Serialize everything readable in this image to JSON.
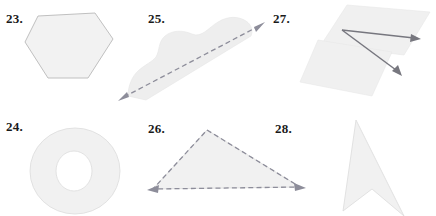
{
  "page": {
    "width": 436,
    "height": 216,
    "background_color": "#ffffff"
  },
  "style_colors": {
    "shape_fill": "#f2f2f2",
    "shape_outline": "#b9b9b9",
    "dashed_stroke": "#8d8d9a",
    "solid_stroke": "#77777f",
    "label_text": "#1a1a1a"
  },
  "figures": [
    {
      "number": "23.",
      "name": "hexagon",
      "shape_type": "hexagon",
      "description": "Convex six-sided polygon, light gray fill with thin gray outline",
      "label_position": {
        "x": 6,
        "y": 12
      },
      "points": "38,16 95,13 113,39 88,78 48,78 25,42",
      "has_dashed_edges": false,
      "has_arrows": false
    },
    {
      "number": "24.",
      "name": "annulus",
      "shape_type": "annulus",
      "description": "Ring / donut: outer ellipse with circular hole removed",
      "label_position": {
        "x": 6,
        "y": 120
      },
      "outer_ellipse": {
        "cx": 75,
        "cy": 171,
        "rx": 45,
        "ry": 43
      },
      "inner_ellipse": {
        "cx": 74,
        "cy": 171,
        "rx": 18,
        "ry": 20
      },
      "has_dashed_edges": false,
      "has_arrows": false
    },
    {
      "number": "25.",
      "name": "curved-blob-with-line",
      "shape_type": "irregular-curved-region",
      "description": "Irregular curved gray region with a dashed double-headed line crossing it diagonally",
      "label_position": {
        "x": 148,
        "y": 12
      },
      "blob_path": "M 128,96 C 128,86 132,76 139,70 C 146,64 152,62 156,57 C 160,50 158,42 165,36 C 172,30 183,30 192,34 C 202,38 208,28 218,22 C 228,16 238,16 246,21 C 252,25 253,31 251,36 L 146,100 Z",
      "dashed_line": {
        "x1": 120,
        "y1": 99,
        "x2": 263,
        "y2": 24
      },
      "has_dashed_edges": true,
      "has_arrows": true,
      "arrow_style": "double-headed"
    },
    {
      "number": "26.",
      "name": "dashed-triangle",
      "shape_type": "triangle",
      "description": "Triangle drawn with dashed sides and arrowheads at the two lower corners",
      "label_position": {
        "x": 148,
        "y": 122
      },
      "points": "207,130 300,187 153,189",
      "has_dashed_edges": true,
      "has_arrows": true,
      "arrow_style": "corner-arrowheads"
    },
    {
      "number": "27.",
      "name": "angle-on-planes",
      "shape_type": "angle",
      "description": "Two solid rays meeting at a common vertex, drawn on two overlapping shaded parallelograms",
      "label_position": {
        "x": 273,
        "y": 12
      },
      "plane_a": "347,5 430,12 404,55 321,45",
      "plane_b": "318,40 392,52 372,96 300,82",
      "vertex": {
        "x": 342,
        "y": 30
      },
      "ray_1_end": {
        "x": 420,
        "y": 39
      },
      "ray_2_end": {
        "x": 401,
        "y": 75
      },
      "has_dashed_edges": false,
      "has_arrows": true,
      "arrow_style": "ray-tips"
    },
    {
      "number": "28.",
      "name": "concave-arrowhead",
      "shape_type": "concave-polygon",
      "description": "Non-convex arrowhead / chevron quadrilateral pointing upward",
      "label_position": {
        "x": 275,
        "y": 122
      },
      "points": "356,120 404,216 372,189 343,211",
      "has_dashed_edges": false,
      "has_arrows": false
    }
  ]
}
